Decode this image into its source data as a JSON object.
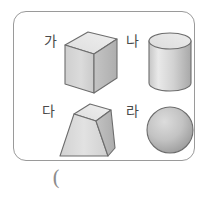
{
  "worksheet": {
    "answer_paren": "(",
    "box": {
      "border_color": "#9a9a9a"
    },
    "shapes": [
      {
        "id": "ga",
        "label": "가",
        "icon": "rectangular-prism-icon",
        "shape_type": "rectangular prism",
        "colors": {
          "top": "#e8e8e8",
          "front": "#d4d4d4",
          "side": "#bdbdbd",
          "outline": "#6d6d6d"
        }
      },
      {
        "id": "na",
        "label": "나",
        "icon": "cylinder-icon",
        "shape_type": "cylinder",
        "colors": {
          "top": "#e3e3e3",
          "body_light": "#e6e6e6",
          "body_dark": "#b0b0b0",
          "outline": "#6d6d6d"
        }
      },
      {
        "id": "da",
        "label": "다",
        "icon": "truncated-pyramid-icon",
        "shape_type": "truncated pyramid",
        "colors": {
          "top": "#e8e8e8",
          "front": "#dcdcdc",
          "side": "#bdbdbd",
          "outline": "#6d6d6d"
        }
      },
      {
        "id": "ra",
        "label": "라",
        "icon": "sphere-icon",
        "shape_type": "sphere",
        "colors": {
          "highlight": "#d8d8d8",
          "shade": "#a0a0a0",
          "outline": "#6d6d6d"
        }
      }
    ]
  }
}
